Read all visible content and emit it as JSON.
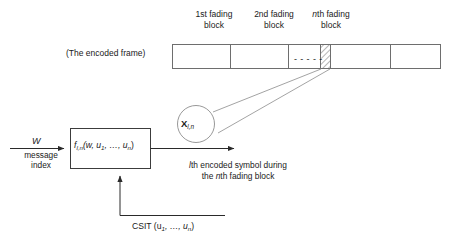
{
  "figure": {
    "type": "block-diagram",
    "background_color": "#ffffff",
    "line_color": "#5a5a5a",
    "text_color": "#1a1a1a"
  },
  "frame": {
    "caption": "(The encoded frame)",
    "ellipsis_marks": "- - - - -",
    "block_labels": [
      {
        "line1": "1st fading",
        "line2": "block"
      },
      {
        "line1": "2nd fading",
        "line2": "block"
      },
      {
        "line1_italic": "n",
        "line1_rest": "th  fading",
        "line2": "block"
      }
    ]
  },
  "magnifier": {
    "symbol_base": "X",
    "symbol_subscript": "l,n"
  },
  "encoder": {
    "function_name": "f",
    "function_subscript": "l,n",
    "function_args": "(w, u",
    "arg_sub_1": "1",
    "args_mid": ", …, u",
    "arg_sub_n": "n",
    "args_close": ")"
  },
  "inputs": {
    "w_symbol": "W",
    "w_caption_line1": "message",
    "w_caption_line2": "index",
    "csit_prefix": "CSIT (u",
    "csit_sub_1": "1",
    "csit_mid": ", …, u",
    "csit_sub_n": "n",
    "csit_close": ")"
  },
  "output": {
    "caption_line1_italic": "l",
    "caption_line1_rest": "th encoded symbol during",
    "caption_line2_pre": "the ",
    "caption_line2_italic": "n",
    "caption_line2_rest": "th fading block"
  }
}
